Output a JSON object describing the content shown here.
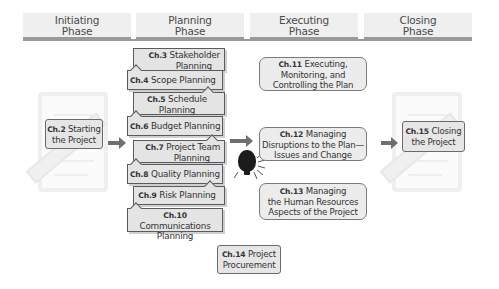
{
  "phases": [
    {
      "line1": "Initiating",
      "line2": "Phase"
    },
    {
      "line1": "Planning",
      "line2": "Phase"
    },
    {
      "line1": "Executing",
      "line2": "Phase"
    },
    {
      "line1": "Closing",
      "line2": "Phase"
    }
  ],
  "initiating": {
    "ch": "Ch.2",
    "line1": " Starting",
    "line2": "the Project"
  },
  "planning": [
    {
      "ch": "Ch.3",
      "line1": " Stakeholder",
      "line2": "Planning"
    },
    {
      "ch": "Ch.4",
      "line1": " Scope Planning",
      "line2": ""
    },
    {
      "ch": "Ch.5",
      "line1": " Schedule",
      "line2": "Planning"
    },
    {
      "ch": "Ch.6",
      "line1": " Budget Planning",
      "line2": ""
    },
    {
      "ch": "Ch.7",
      "line1": " Project Team",
      "line2": "Planning"
    },
    {
      "ch": "Ch.8",
      "line1": " Quality Planning",
      "line2": ""
    },
    {
      "ch": "Ch.9",
      "line1": " Risk Planning",
      "line2": ""
    },
    {
      "ch": "Ch.10",
      "line1": " Communications",
      "line2": "Planning"
    }
  ],
  "executing": [
    {
      "ch": "Ch.11",
      "line1": " Executing,",
      "line2": "Monitoring, and",
      "line3": "Controlling the Plan"
    },
    {
      "ch": "Ch.12",
      "line1": " Managing",
      "line2": "Disruptions to the Plan—",
      "line3": "Issues and Change"
    },
    {
      "ch": "Ch.13",
      "line1": " Managing",
      "line2": "the Human Resources",
      "line3": "Aspects of the Project"
    }
  ],
  "procurement": {
    "ch": "Ch.14",
    "line1": " Project",
    "line2": "Procurement"
  },
  "closing": {
    "ch": "Ch.15",
    "line1": " Closing",
    "line2": "the Project"
  },
  "icons": {
    "idea": "light-bulb-icon",
    "flow": "arrow-right-icon",
    "watermark": "document-pencil-icon"
  }
}
